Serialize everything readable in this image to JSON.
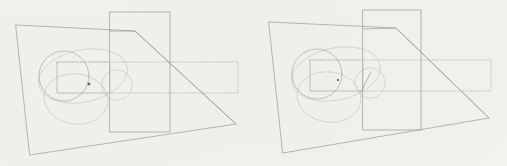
{
  "document": {
    "title": "Geometric Figure Pair",
    "background_color": "#fdfdfc",
    "width": 507,
    "height": 166,
    "panel_count": 2
  },
  "watermarks": {
    "top_text": "",
    "bottom_text": ""
  },
  "style": {
    "solid_stroke_color": "#9a9a9a",
    "dotted_stroke_color": "#b4b4b4",
    "circle_stroke_color": "#a8a8a8",
    "marker_color": "#5a5a5a",
    "solid_stroke_width": 0.7,
    "dotted_stroke_width": 0.7,
    "dash_pattern": "1,1.6"
  },
  "panels": [
    {
      "id": "panel-left",
      "name": "left-figure",
      "origin_x": 0,
      "shapes": {
        "quadrilateral": {
          "name": "outer-quadrilateral",
          "stroke": "solid",
          "points": "16,25 135,31 236,124 30,155"
        },
        "rectangle_solid": {
          "name": "vertical-rectangle",
          "stroke": "solid",
          "x": 110,
          "y": 12,
          "width": 60,
          "height": 120
        },
        "rectangle_dotted": {
          "name": "horizontal-dotted-rectangle",
          "stroke": "dotted",
          "x": 57,
          "y": 62,
          "width": 181,
          "height": 31
        },
        "rectangle_dotted_small": {
          "name": "inner-dotted-rectangle",
          "stroke": "dotted",
          "x": 57,
          "y": 62,
          "width": 53,
          "height": 31
        },
        "chamfer_line": {
          "name": "chamfer-diagonal",
          "stroke": "solid",
          "points": "110,31 135,31 236,124"
        },
        "circle_main": {
          "name": "main-circle",
          "stroke": "solid",
          "cx": 64,
          "cy": 76,
          "r": 25
        },
        "ellipse_upper": {
          "name": "upper-dotted-ellipse",
          "stroke": "dotted",
          "cx": 83,
          "cy": 76,
          "rx": 45,
          "ry": 26,
          "rotate": -12
        },
        "ellipse_lower": {
          "name": "lower-dotted-ellipse",
          "stroke": "dotted",
          "cx": 76,
          "cy": 99,
          "rx": 32,
          "ry": 25,
          "rotate": 8
        },
        "circle_small": {
          "name": "small-dotted-circle",
          "stroke": "dotted",
          "cx": 117,
          "cy": 85,
          "r": 15
        },
        "marker": {
          "name": "marker-point",
          "shape": "square",
          "x": 89,
          "y": 84,
          "size": 2.4
        }
      }
    },
    {
      "id": "panel-right",
      "name": "right-figure",
      "origin_x": 253,
      "shapes": {
        "quadrilateral": {
          "name": "outer-quadrilateral",
          "stroke": "solid",
          "points": "16,22 143,28 236,118 30,153"
        },
        "rectangle_solid": {
          "name": "vertical-rectangle",
          "stroke": "solid",
          "x": 110,
          "y": 10,
          "width": 58,
          "height": 120
        },
        "rectangle_dotted": {
          "name": "horizontal-dotted-rectangle",
          "stroke": "dotted",
          "x": 57,
          "y": 60,
          "width": 181,
          "height": 31
        },
        "rectangle_dotted_small": {
          "name": "inner-dotted-rectangle",
          "stroke": "dotted",
          "x": 57,
          "y": 60,
          "width": 53,
          "height": 31
        },
        "chamfer_line": {
          "name": "chamfer-diagonal",
          "stroke": "solid",
          "points": "110,29 143,28 236,118"
        },
        "circle_main": {
          "name": "main-circle",
          "stroke": "solid",
          "cx": 64,
          "cy": 74,
          "r": 25
        },
        "ellipse_upper": {
          "name": "upper-dotted-ellipse",
          "stroke": "dotted",
          "cx": 83,
          "cy": 74,
          "rx": 45,
          "ry": 26,
          "rotate": -12
        },
        "ellipse_lower": {
          "name": "lower-dotted-ellipse",
          "stroke": "dotted",
          "cx": 76,
          "cy": 97,
          "rx": 32,
          "ry": 25,
          "rotate": 8
        },
        "circle_small": {
          "name": "small-dotted-circle",
          "stroke": "dotted",
          "cx": 117,
          "cy": 83,
          "r": 15
        },
        "marker": {
          "name": "marker-point",
          "shape": "dot",
          "x": 85,
          "y": 80,
          "size": 2.2
        },
        "tangent_segment": {
          "name": "tangent-line-segment",
          "stroke": "solid",
          "x1": 108,
          "y1": 92,
          "x2": 118,
          "y2": 72
        }
      }
    }
  ]
}
